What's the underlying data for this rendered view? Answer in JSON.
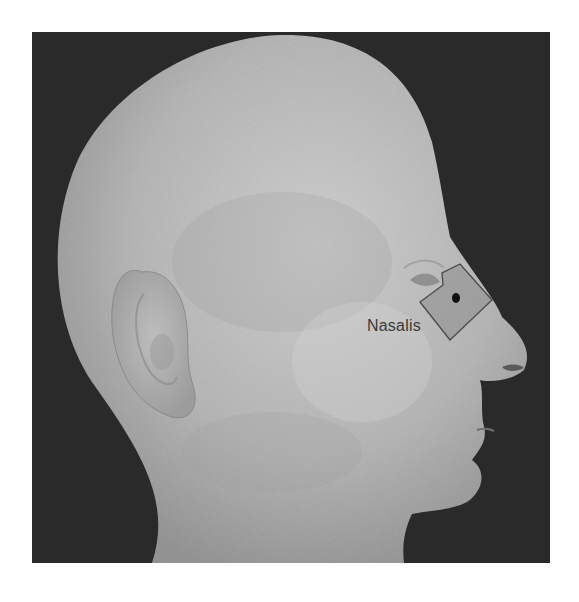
{
  "figure": {
    "background_color": "#2a2a2a",
    "skin_color": "#b9b9b9"
  },
  "annotation": {
    "label": "Nasalis",
    "region_fill": "#8c8c8c",
    "outline_color": "#4a4a4a",
    "marker_color": "#111111"
  }
}
